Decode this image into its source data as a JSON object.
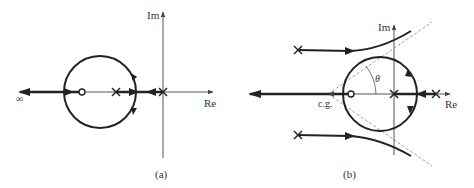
{
  "figure": {
    "panels": [
      {
        "id": "a",
        "caption": "(a)",
        "axis_labels": {
          "real": "Re",
          "imag": "Im"
        },
        "infinity_label": "∞",
        "poles": 2,
        "zeros": 1
      },
      {
        "id": "b",
        "caption": "(b)",
        "axis_labels": {
          "real": "Re",
          "imag": "Im"
        },
        "centroid_label": "c.g.",
        "angle_label": "θ",
        "poles": 4,
        "zeros": 1
      }
    ],
    "colors": {
      "ink": "#222222",
      "axis": "#555555",
      "asymptote": "#888888",
      "text": "#333333"
    }
  }
}
